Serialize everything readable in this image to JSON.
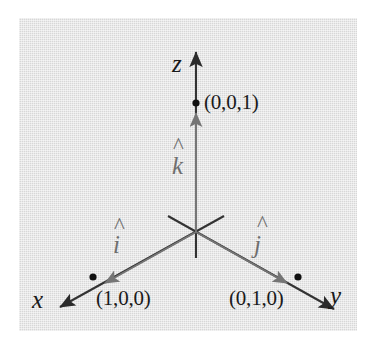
{
  "figure": {
    "background_color": "#d7d7d7",
    "axis_color": "#333333",
    "vector_color": "#6e6e6e",
    "point_color": "#111111",
    "axes": [
      {
        "name": "x",
        "label": "x",
        "label_x": 32,
        "label_y": 300
      },
      {
        "name": "y",
        "label": "y",
        "label_x": 330,
        "label_y": 296
      },
      {
        "name": "z",
        "label": "z",
        "label_x": 172,
        "label_y": 68
      }
    ],
    "unit_vectors": [
      {
        "name": "i-hat",
        "label": "i",
        "hat": "^",
        "label_x": 113,
        "label_y": 247,
        "hat_x": 115,
        "hat_y": 226
      },
      {
        "name": "j-hat",
        "label": "j",
        "hat": "^",
        "label_x": 254,
        "label_y": 250,
        "hat_x": 258,
        "hat_y": 226
      },
      {
        "name": "k-hat",
        "label": "k",
        "hat": "^",
        "label_x": 172,
        "label_y": 168,
        "hat_x": 174,
        "hat_y": 145
      }
    ],
    "points": [
      {
        "name": "point-x",
        "label": "(1,0,0)",
        "dot_x": 93,
        "dot_y": 277,
        "label_x": 96,
        "label_y": 303
      },
      {
        "name": "point-y",
        "label": "(0,1,0)",
        "dot_x": 298,
        "dot_y": 277,
        "label_x": 229,
        "label_y": 303
      },
      {
        "name": "point-z",
        "label": "(0,0,1)",
        "dot_x": 196,
        "dot_y": 103,
        "label_x": 204,
        "label_y": 112
      }
    ],
    "origin": {
      "x": 196,
      "y": 232
    }
  }
}
